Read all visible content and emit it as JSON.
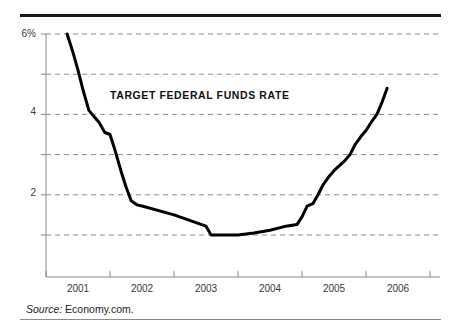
{
  "figure": {
    "title": "TARGET FEDERAL FUNDS RATE",
    "source_label": "Source:",
    "source_value": "Economy.com.",
    "top_rule_color": "#1a1a1a",
    "bottom_rule_color": "#8a8a8a",
    "line_color": "#000000",
    "grid_color": "#8c8c8c",
    "axis_color": "#8c8c8c",
    "background": "#ffffff"
  },
  "chart_data": {
    "type": "line",
    "title": "TARGET FEDERAL FUNDS RATE",
    "xlabel": "",
    "ylabel": "",
    "ylim": [
      0,
      6
    ],
    "xlim": [
      2000.75,
      2006.25
    ],
    "grid": true,
    "grid_style": "dashed-horizontal",
    "legend": "none",
    "y_ticklabels": [
      "6%",
      "4",
      "2"
    ],
    "y_tickvalues": [
      6,
      4,
      2
    ],
    "y_gridvalues": [
      6,
      5,
      4,
      3,
      2,
      1
    ],
    "x_ticklabels": [
      "2001",
      "2002",
      "2003",
      "2004",
      "2005",
      "2006"
    ],
    "x_tickvalues": [
      2001,
      2002,
      2003,
      2004,
      2005,
      2006
    ],
    "units": "percent",
    "series": [
      {
        "name": "Target federal funds rate",
        "x": [
          2000.83,
          2000.92,
          2001.0,
          2001.08,
          2001.17,
          2001.25,
          2001.33,
          2001.42,
          2001.5,
          2001.58,
          2001.67,
          2001.75,
          2001.83,
          2001.92,
          2002.0,
          2002.5,
          2003.0,
          2003.08,
          2003.5,
          2003.75,
          2004.0,
          2004.25,
          2004.42,
          2004.5,
          2004.58,
          2004.67,
          2004.75,
          2004.83,
          2004.92,
          2005.0,
          2005.17,
          2005.25,
          2005.33,
          2005.42,
          2005.5,
          2005.58,
          2005.67,
          2005.75,
          2005.83
        ],
        "y": [
          6.0,
          5.55,
          5.1,
          4.6,
          4.1,
          3.95,
          3.8,
          3.55,
          3.5,
          3.1,
          2.6,
          2.2,
          1.85,
          1.75,
          1.72,
          1.5,
          1.22,
          1.0,
          1.0,
          1.05,
          1.12,
          1.22,
          1.26,
          1.45,
          1.72,
          1.78,
          2.0,
          2.25,
          2.45,
          2.6,
          2.85,
          3.0,
          3.25,
          3.45,
          3.6,
          3.8,
          4.0,
          4.3,
          4.65
        ]
      }
    ]
  }
}
